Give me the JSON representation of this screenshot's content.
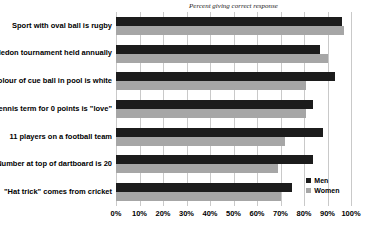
{
  "chart_data": {
    "type": "bar",
    "orientation": "horizontal",
    "title": "Percent giving correct response",
    "categories": [
      "Sport with oval ball is rugby",
      "Wimbledon tournament held annually",
      "Colour of cue ball in pool is white",
      "Tennis term for 0 points is \"love\"",
      "11 players on a football team",
      "Number at top of dartboard is 20",
      "\"Hat trick\" comes from cricket"
    ],
    "series": [
      {
        "name": "Men",
        "color": "#1c1c1c",
        "values": [
          96,
          87,
          93,
          84,
          88,
          84,
          75
        ]
      },
      {
        "name": "Women",
        "color": "#a6a6a6",
        "values": [
          97,
          90,
          81,
          81,
          72,
          69,
          70
        ]
      }
    ],
    "xlim": [
      0,
      100
    ],
    "x_tick_labels": [
      "0%",
      "10%",
      "20%",
      "30%",
      "40%",
      "50%",
      "60%",
      "70%",
      "80%",
      "90%",
      "100%"
    ],
    "grid": true,
    "legend_position": "inside-bottom-right",
    "colors": {
      "background": "#ffffff",
      "gridline": "#c9c9c9",
      "text": "#000000"
    }
  }
}
